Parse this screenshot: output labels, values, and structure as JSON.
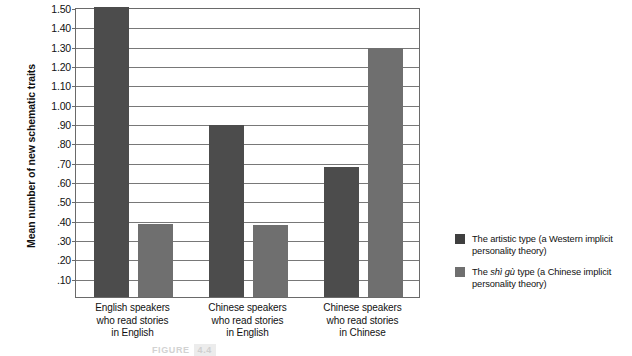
{
  "chart_data": {
    "type": "bar",
    "title": "",
    "xlabel": "",
    "ylabel": "Mean number of new schematic traits",
    "ylim": [
      0,
      1.5
    ],
    "ytick_step": 0.1,
    "grid": true,
    "legend_position": "right",
    "categories": [
      "English speakers\nwho read stories\nin English",
      "Chinese speakers\nwho read stories\nin English",
      "Chinese speakers\nwho read stories\nin Chinese"
    ],
    "category_lines": [
      [
        "English speakers",
        "who read stories",
        "in English"
      ],
      [
        "Chinese speakers",
        "who read stories",
        "in English"
      ],
      [
        "Chinese speakers",
        "who read stories",
        "in Chinese"
      ]
    ],
    "ytick_labels": [
      "1.50",
      "1.40",
      "1.30",
      "1.20",
      "1.10",
      "1.00",
      ".90",
      ".80",
      ".70",
      ".60",
      ".50",
      ".40",
      ".30",
      ".20",
      ".10"
    ],
    "ytick_values": [
      1.5,
      1.4,
      1.3,
      1.2,
      1.1,
      1.0,
      0.9,
      0.8,
      0.7,
      0.6,
      0.5,
      0.4,
      0.3,
      0.2,
      0.1
    ],
    "series": [
      {
        "name": "The artistic type (a Western implicit personality theory)",
        "color": "#4c4c4c",
        "values": [
          1.5,
          0.89,
          0.67
        ]
      },
      {
        "name": "The shì gù type (a Chinese implicit personality theory)",
        "color": "#6f6f6f",
        "values": [
          0.38,
          0.37,
          1.29
        ]
      }
    ]
  },
  "legend": {
    "entries": [
      {
        "swatch": "s0",
        "pre": "The artistic type (a Western implicit personality theory)",
        "italic": "",
        "post": ""
      },
      {
        "swatch": "s1",
        "pre": "The ",
        "italic": "shì gù",
        "post": " type (a Chinese implicit personality theory)"
      }
    ]
  },
  "caption": {
    "label": "FIGURE",
    "number": "4.4"
  }
}
